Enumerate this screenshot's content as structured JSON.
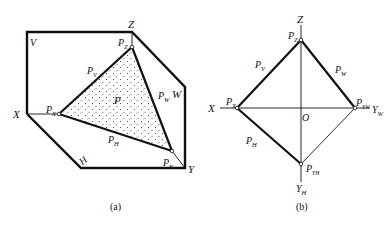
{
  "figure_a": {
    "caption": "(a)",
    "labels": {
      "V": "V",
      "Z": "Z",
      "X": "X",
      "Y": "Y",
      "W": "W",
      "H": "H",
      "P": "P",
      "Pz": "P",
      "Pz_sub": "Z",
      "Px": "P",
      "Px_sub": "X",
      "Py": "P",
      "Py_sub": "Y",
      "Pv": "P",
      "Pv_sub": "V",
      "Pw": "P",
      "Pw_sub": "W",
      "Ph": "P",
      "Ph_sub": "H"
    }
  },
  "figure_b": {
    "caption": "(b)",
    "labels": {
      "Z": "Z",
      "X": "X",
      "O": "O",
      "Yw": "Y",
      "Yw_sub": "W",
      "Yh": "Y",
      "Yh_sub": "H",
      "Pz": "P",
      "Pz_sub": "Z",
      "Px": "P",
      "Px_sub": "X",
      "Pyw": "P",
      "Pyw_sub": "YW",
      "Pyh": "P",
      "Pyh_sub": "YH",
      "Pv": "P",
      "Pv_sub": "V",
      "Pw": "P",
      "Pw_sub": "W",
      "Ph": "P",
      "Ph_sub": "H"
    }
  },
  "colors": {
    "line": "#111111",
    "fill_dots": "#333333",
    "background": "#ffffff"
  }
}
